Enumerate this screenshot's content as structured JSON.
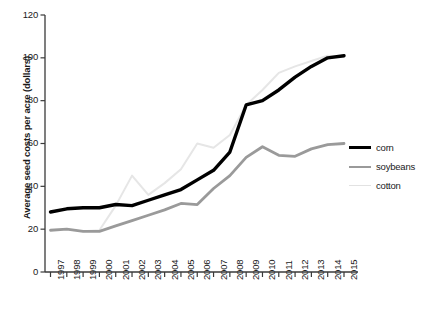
{
  "chart_data": {
    "type": "line",
    "title": "",
    "xlabel": "",
    "ylabel": "Average seed costs per acre (dollars)",
    "ylim": [
      0,
      120
    ],
    "yticks": [
      0,
      20,
      40,
      60,
      80,
      100,
      120
    ],
    "ytick_labels": [
      "0",
      "20",
      "40",
      "60",
      "80",
      "100",
      "120"
    ],
    "grid": false,
    "legend_position": "right",
    "x": [
      1997,
      1998,
      1999,
      2000,
      2001,
      2002,
      2003,
      2004,
      2005,
      2006,
      2007,
      2008,
      2009,
      2010,
      2011,
      2012,
      2013,
      2014,
      2015
    ],
    "categories": [
      "1997",
      "1998",
      "1999",
      "2000",
      "2001",
      "2002",
      "2003",
      "2004",
      "2005",
      "2006",
      "2007",
      "2008",
      "2009",
      "2010",
      "2011",
      "2012",
      "2013",
      "2014",
      "2015"
    ],
    "series": [
      {
        "name": "corn",
        "color": "#000000",
        "width": 3.4,
        "values": [
          28,
          29.5,
          30,
          30,
          31.5,
          31,
          33.5,
          36,
          38.5,
          43,
          47.5,
          56,
          78,
          80,
          85,
          91,
          96,
          100,
          101
        ]
      },
      {
        "name": "soybeans",
        "color": "#9a9a9a",
        "width": 2.8,
        "values": [
          19.5,
          20,
          19,
          19,
          21.5,
          24,
          26.5,
          29,
          32,
          31.5,
          39,
          45,
          53.5,
          58.5,
          54.5,
          54,
          57.5,
          59.5,
          60
        ]
      },
      {
        "name": "cotton",
        "color": "#e6e6e6",
        "width": 2.0,
        "values": [
          null,
          null,
          19,
          19.5,
          31,
          45,
          36,
          41.5,
          48,
          60,
          58,
          64,
          78,
          85,
          93,
          96,
          98.5,
          101,
          100.5
        ]
      }
    ]
  },
  "legend": {
    "items": [
      {
        "label": "corn",
        "key": "corn"
      },
      {
        "label": "soybeans",
        "key": "soybeans"
      },
      {
        "label": "cotton",
        "key": "cotton"
      }
    ]
  },
  "colors": {
    "corn": "#000000",
    "soybeans": "#9a9a9a",
    "cotton": "#e6e6e6",
    "axis": "#3a3a3a",
    "text": "#1a1a1a",
    "background": "#ffffff"
  }
}
